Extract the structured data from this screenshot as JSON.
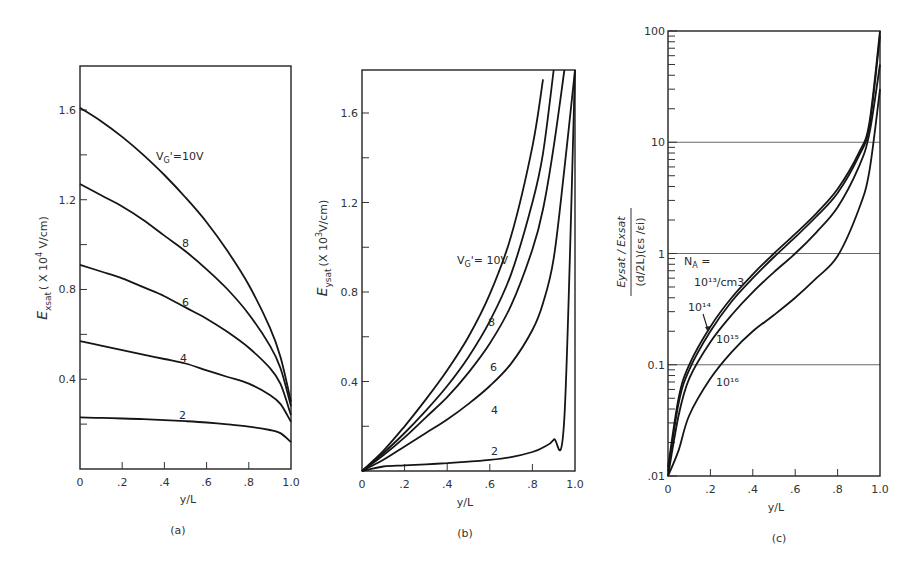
{
  "chart_data": [
    {
      "panel": "(a)",
      "type": "line",
      "title": "",
      "xlabel": "y/L",
      "ylabel": "Exsat (x 10^4 V/cm)",
      "xlim": [
        0,
        1.0
      ],
      "ylim": [
        0,
        1.8
      ],
      "xticks": [
        "0",
        ".2",
        ".4",
        ".6",
        ".8",
        "1.0"
      ],
      "yticks": [
        "0.4",
        "0.8",
        "1.2",
        "1.6"
      ],
      "grid": false,
      "x": [
        0,
        0.1,
        0.2,
        0.3,
        0.4,
        0.5,
        0.6,
        0.7,
        0.8,
        0.9,
        0.95,
        1.0
      ],
      "series": [
        {
          "name": "V'G = 10V",
          "label": "V'G =10V",
          "values": [
            1.61,
            1.55,
            1.48,
            1.4,
            1.31,
            1.21,
            1.1,
            0.97,
            0.82,
            0.63,
            0.5,
            0.3
          ]
        },
        {
          "name": "8",
          "label": "8",
          "values": [
            1.27,
            1.22,
            1.17,
            1.11,
            1.04,
            0.97,
            0.89,
            0.8,
            0.69,
            0.55,
            0.45,
            0.28
          ]
        },
        {
          "name": "6",
          "label": "6",
          "values": [
            0.91,
            0.88,
            0.85,
            0.81,
            0.77,
            0.72,
            0.67,
            0.61,
            0.54,
            0.45,
            0.38,
            0.24
          ]
        },
        {
          "name": "4",
          "label": "4",
          "values": [
            0.57,
            0.55,
            0.53,
            0.51,
            0.49,
            0.47,
            0.44,
            0.41,
            0.38,
            0.33,
            0.29,
            0.21
          ]
        },
        {
          "name": "2",
          "label": "2",
          "values": [
            0.23,
            0.228,
            0.225,
            0.222,
            0.218,
            0.213,
            0.207,
            0.199,
            0.189,
            0.174,
            0.16,
            0.12
          ]
        }
      ]
    },
    {
      "panel": "(b)",
      "type": "line",
      "title": "",
      "xlabel": "y/L",
      "ylabel": "Eysat (x 10^3 V/cm)",
      "xlim": [
        0,
        1.0
      ],
      "ylim": [
        0,
        1.8
      ],
      "xticks": [
        "0",
        ".2",
        ".4",
        ".6",
        ".8",
        "1.0"
      ],
      "yticks": [
        "0.4",
        "0.8",
        "1.2",
        "1.6"
      ],
      "grid": false,
      "x": [
        0,
        0.1,
        0.2,
        0.3,
        0.4,
        0.5,
        0.6,
        0.7,
        0.8,
        0.85,
        0.9,
        0.95,
        1.0
      ],
      "series": [
        {
          "name": "V'G = 10V",
          "label": "V'G = 10V",
          "values": [
            0,
            0.09,
            0.2,
            0.32,
            0.45,
            0.6,
            0.79,
            1.05,
            1.45,
            1.75,
            null,
            null,
            null
          ]
        },
        {
          "name": "8",
          "label": "8",
          "values": [
            0,
            0.08,
            0.17,
            0.27,
            0.38,
            0.51,
            0.67,
            0.88,
            1.2,
            1.42,
            1.8,
            null,
            null
          ]
        },
        {
          "name": "6",
          "label": "6",
          "values": [
            0,
            0.07,
            0.15,
            0.24,
            0.33,
            0.44,
            0.57,
            0.74,
            0.99,
            1.17,
            1.45,
            1.8,
            null
          ]
        },
        {
          "name": "4",
          "label": "4",
          "values": [
            0,
            0.05,
            0.11,
            0.17,
            0.23,
            0.3,
            0.38,
            0.48,
            0.63,
            0.75,
            0.95,
            1.35,
            1.8
          ]
        },
        {
          "name": "2",
          "label": "2",
          "values": [
            0,
            0.02,
            0.025,
            0.03,
            0.035,
            0.042,
            0.05,
            0.062,
            0.085,
            0.105,
            0.14,
            0.24,
            1.8
          ]
        }
      ]
    },
    {
      "panel": "(c)",
      "type": "line",
      "title": "",
      "xlabel": "y/L",
      "ylabel": "(Eysat / Exsat) / ((d/2L)(εs/εi))",
      "xlim": [
        0,
        1.0
      ],
      "ylim": [
        0.01,
        100
      ],
      "yscale": "log",
      "xticks": [
        "0",
        ".2",
        ".4",
        ".6",
        ".8",
        "1.0"
      ],
      "yticks": [
        ".01",
        "0.1",
        "1",
        "10",
        "100"
      ],
      "grid": true,
      "legend_title": "NA =",
      "x": [
        0,
        0.05,
        0.1,
        0.2,
        0.3,
        0.4,
        0.5,
        0.6,
        0.7,
        0.8,
        0.9,
        0.95,
        1.0
      ],
      "series": [
        {
          "name": "NA = 10^13/cm3",
          "label": "10^13/cm3",
          "values": [
            0.012,
            0.05,
            0.1,
            0.22,
            0.4,
            0.65,
            1.0,
            1.5,
            2.3,
            3.8,
            8.0,
            15,
            100
          ]
        },
        {
          "name": "10^14",
          "label": "10^14",
          "values": [
            0.011,
            0.045,
            0.09,
            0.2,
            0.37,
            0.6,
            0.93,
            1.4,
            2.15,
            3.5,
            7.5,
            14,
            90
          ]
        },
        {
          "name": "10^15",
          "label": "10^15",
          "values": [
            0.01,
            0.035,
            0.075,
            0.16,
            0.28,
            0.45,
            0.68,
            1.0,
            1.55,
            2.6,
            6.0,
            12,
            50
          ]
        },
        {
          "name": "10^16",
          "label": "10^16",
          "values": [
            0.008,
            0.017,
            0.035,
            0.075,
            0.13,
            0.2,
            0.28,
            0.4,
            0.6,
            0.95,
            2.5,
            5.5,
            30
          ]
        }
      ]
    }
  ],
  "panels": {
    "a": {
      "caption": "(a)",
      "xlabel": "y/L",
      "ylabel_main": "E",
      "ylabel_sub": "xsat",
      "ylabel_unit": "( X 10",
      "ylabel_exp": "4",
      "ylabel_tail": " V/cm)",
      "xticks": [
        "0",
        ".2",
        ".4",
        ".6",
        ".8",
        "1.0"
      ],
      "yticks": [
        "0.4",
        "0.8",
        "1.2",
        "1.6"
      ],
      "curve_labels": [
        "V'G =10V",
        "8",
        "6",
        "4",
        "2"
      ]
    },
    "b": {
      "caption": "(b)",
      "xlabel": "y/L",
      "ylabel_main": "E",
      "ylabel_sub": "ysat",
      "ylabel_unit": "(X 10",
      "ylabel_exp": "3",
      "ylabel_tail": "V/cm)",
      "xticks": [
        "0",
        ".2",
        ".4",
        ".6",
        ".8",
        "1.0"
      ],
      "yticks": [
        "0.4",
        "0.8",
        "1.2",
        "1.6"
      ],
      "curve_labels": [
        "V'G= 10V",
        "8",
        "6",
        "4",
        "2"
      ]
    },
    "c": {
      "caption": "(c)",
      "xlabel": "y/L",
      "ylabel_num": "Eysat / Exsat",
      "ylabel_den": "(d/2L)(εs /εi)",
      "xticks": [
        "0",
        ".2",
        ".4",
        ".6",
        ".8",
        "1.0"
      ],
      "yticks": [
        ".01",
        "0.1",
        "1",
        "10",
        "100"
      ],
      "legend_title": "NA =",
      "curve_labels": [
        "10¹³/cm3",
        "10¹⁴",
        "10¹⁵",
        "10¹⁶"
      ]
    }
  }
}
